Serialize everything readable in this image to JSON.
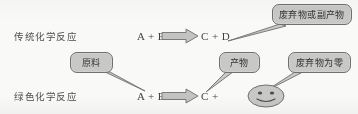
{
  "figure": {
    "type": "comparison-diagram",
    "background_color": "#fbfbfa",
    "box_fill_color": "#c9c9c7",
    "box_border_color": "#6e6e6c",
    "arrow_fill_color": "#c4c4c2",
    "arrow_border_color": "#6e6e6c",
    "text_color": "#3f3f3f"
  },
  "rows": {
    "traditional": {
      "label": "传统化学反应",
      "reactants": "A + B",
      "products": "C + D",
      "arrow": "block-arrow-right"
    },
    "green": {
      "label": "绿色化学反应",
      "reactants": "A + B",
      "products": "C +",
      "arrow": "block-arrow-right",
      "extra_symbol": "smiley-face"
    }
  },
  "callouts": {
    "waste_byproduct": "废弃物或副产物",
    "raw_material": "原料",
    "product": "产物",
    "zero_waste": "废弃物为零"
  }
}
